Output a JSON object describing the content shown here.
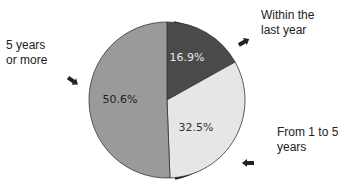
{
  "chart_data": {
    "type": "pie",
    "title": "",
    "start_angle": "12 o'clock",
    "direction": "clockwise",
    "slices": [
      {
        "label": "Within the last year",
        "label_lines": [
          "Within the",
          "last year"
        ],
        "value": 16.9,
        "display": "16.9%",
        "color": "#4a4a4a",
        "text_color": "#e8e8e8"
      },
      {
        "label": "From 1 to 5 years",
        "label_lines": [
          "From 1 to 5",
          "years"
        ],
        "value": 32.5,
        "display": "32.5%",
        "color": "#e6e6e6",
        "text_color": "#333333"
      },
      {
        "label": "5 years or more",
        "label_lines": [
          "5 years",
          "or more"
        ],
        "value": 50.6,
        "display": "50.6%",
        "color": "#9a9a9a",
        "text_color": "#222222"
      }
    ],
    "shadow_color": "#111111",
    "legend": "callout labels with arrows"
  }
}
